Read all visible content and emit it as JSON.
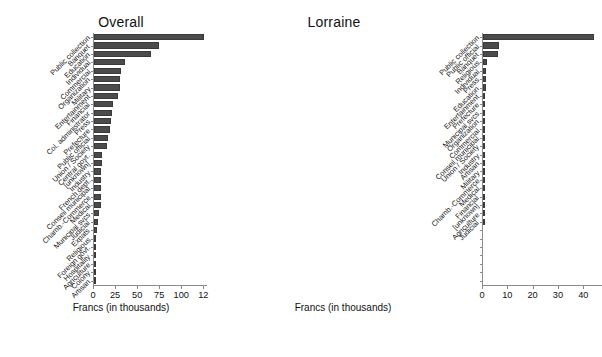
{
  "figure": {
    "xlabel": "Francs (in thousands)"
  },
  "chart_data": [
    {
      "type": "bar",
      "orientation": "horizontal",
      "title": "Overall",
      "xlabel": "Francs (in thousands)",
      "ylabel": "",
      "xlim": [
        0,
        128
      ],
      "xticks": [
        0,
        25,
        50,
        75,
        100,
        125
      ],
      "xtick_labels": [
        "0",
        "25",
        "50",
        "75",
        "100",
        "12"
      ],
      "grid": false,
      "legend": "none",
      "bar_color": "#4b4b4b",
      "categories": [
        "Public collection",
        "Banquet",
        "Education",
        "Individual",
        "Commercial",
        "Organization",
        "Military",
        "Entertainment",
        "Financial",
        "Col. administrator",
        "Press",
        "Prefecture",
        "Public official",
        "Union / Society",
        "Central govt.",
        "[unknown]",
        "Industry",
        "French dept.",
        "Conseil municipal",
        "Chamb.-Commerce",
        "Medical",
        "Municipal svcs",
        "Judicial",
        "Expats",
        "Religious",
        "Foreign govt.",
        "Hospitality",
        "Agriculture",
        "Colony",
        "Artisan"
      ],
      "values": [
        125.0,
        74.0,
        65.0,
        35.0,
        31.0,
        30.0,
        29.0,
        27.0,
        22.0,
        20.0,
        19.0,
        18.0,
        16.0,
        15.0,
        9.0,
        8.5,
        8.2,
        8.0,
        8.0,
        8.0,
        7.8,
        6.0,
        4.5,
        3.0,
        1.6,
        1.2,
        0.6,
        0.4,
        0.3,
        0.2
      ]
    },
    {
      "type": "bar",
      "orientation": "horizontal",
      "title": "Lorraine",
      "xlabel": "Francs (in thousands)",
      "ylabel": "",
      "xlim": [
        0,
        47
      ],
      "xticks": [
        0,
        10,
        20,
        30,
        40
      ],
      "xtick_labels": [
        "0",
        "10",
        "20",
        "30",
        "40"
      ],
      "grid": false,
      "legend": "none",
      "bar_color": "#4b4b4b",
      "categories": [
        "Public collection",
        "Public official",
        "Banquet",
        "Religious",
        "Individual",
        "Press",
        "Education",
        "Entertainment",
        "Prefecture",
        "Municipal svcs",
        "Organization",
        "Commercial",
        "Conseil municipal",
        "Union / Society",
        "Industry",
        "Artisan",
        "Military",
        "Chamb.-Commerce",
        "Medical",
        "Financial",
        "[unknown]",
        "Agriculture",
        "Judicial",
        "",
        "",
        "",
        "",
        "",
        "",
        ""
      ],
      "values": [
        44.0,
        6.2,
        6.0,
        1.4,
        1.1,
        1.0,
        1.0,
        0.9,
        0.9,
        0.8,
        0.7,
        0.6,
        0.5,
        0.45,
        0.35,
        0.3,
        0.1,
        0.1,
        0.1,
        0.1,
        0.1,
        0.1,
        0.1,
        0,
        0,
        0,
        0,
        0,
        0,
        0
      ]
    }
  ]
}
